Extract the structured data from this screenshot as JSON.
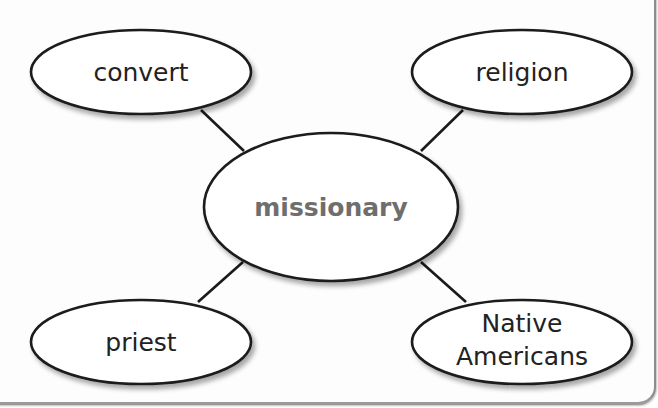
{
  "diagram": {
    "type": "word-web",
    "colors": {
      "stroke": "#1a1a1a",
      "fill": "#ffffff",
      "center_text": "#6e6e6e",
      "node_text": "#222222"
    },
    "center": {
      "label": "missionary"
    },
    "nodes": [
      {
        "id": "top-left",
        "label": "convert"
      },
      {
        "id": "top-right",
        "label": "religion"
      },
      {
        "id": "bottom-left",
        "label": "priest"
      },
      {
        "id": "bottom-right",
        "label_line1": "Native",
        "label_line2": "Americans"
      }
    ],
    "edges": [
      {
        "from": "missionary",
        "to": "convert"
      },
      {
        "from": "missionary",
        "to": "religion"
      },
      {
        "from": "missionary",
        "to": "priest"
      },
      {
        "from": "missionary",
        "to": "Native Americans"
      }
    ]
  }
}
